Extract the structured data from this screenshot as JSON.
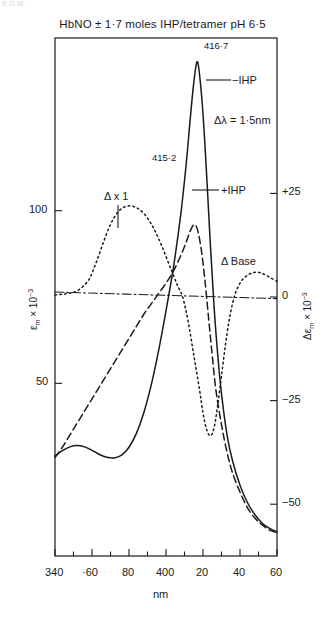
{
  "corner_stamp": "S.D.M.",
  "chart_data": {
    "type": "line",
    "title": "HbNO ± 1·7 moles IHP/tetramer pH 6·5",
    "xlabel": "nm",
    "ylabel": "εm × 10⁻³",
    "ylabel_right": "Δεm × 10⁻³",
    "xlim": [
      340,
      460
    ],
    "ylim": [
      0,
      150
    ],
    "ylim_right": [
      -62.5,
      62.5
    ],
    "grid": false,
    "legend_position": "inline-annotations",
    "x_ticks_major": [
      {
        "value": 340,
        "label": "340"
      },
      {
        "value": 360,
        "label": "·60"
      },
      {
        "value": 380,
        "label": "80"
      },
      {
        "value": 400,
        "label": "400"
      },
      {
        "value": 420,
        "label": "20"
      },
      {
        "value": 440,
        "label": "40"
      },
      {
        "value": 460,
        "label": "60"
      }
    ],
    "x_ticks_minor": [
      350,
      370,
      390,
      410,
      430,
      450
    ],
    "y_ticks_left": [
      {
        "value": 50,
        "label": "50"
      },
      {
        "value": 100,
        "label": "100"
      }
    ],
    "y_ticks_right": [
      {
        "value": 25,
        "label": "+25"
      },
      {
        "value": 0,
        "label": "0"
      },
      {
        "value": -25,
        "label": "−25"
      },
      {
        "value": -50,
        "label": "−50"
      }
    ],
    "annotations": [
      {
        "name": "peak-label-minus-ihp",
        "text": "416·7"
      },
      {
        "name": "peak-label-plus-ihp",
        "text": "415·2"
      },
      {
        "name": "series-label-minus-ihp",
        "text": "−IHP"
      },
      {
        "name": "series-label-plus-ihp",
        "text": "+IHP"
      },
      {
        "name": "delta-lambda-annotation",
        "text": "Δλ = 1·5nm"
      },
      {
        "name": "delta-multiplier-annotation",
        "text": "Δ x 1"
      },
      {
        "name": "delta-base-annotation",
        "text": "Δ Base"
      }
    ],
    "series": [
      {
        "name": "−IHP",
        "style": "solid",
        "axis": "left",
        "peak_nm": 416.7,
        "peak_value": 143,
        "points": [
          [
            340,
            29
          ],
          [
            344,
            30.5
          ],
          [
            348,
            31.6
          ],
          [
            352,
            32.0
          ],
          [
            356,
            31.6
          ],
          [
            360,
            30.6
          ],
          [
            364,
            29.4
          ],
          [
            368,
            28.6
          ],
          [
            372,
            28.4
          ],
          [
            376,
            29.2
          ],
          [
            380,
            31.5
          ],
          [
            384,
            35.5
          ],
          [
            388,
            41.5
          ],
          [
            392,
            49.5
          ],
          [
            396,
            59.5
          ],
          [
            400,
            71.0
          ],
          [
            404,
            83.5
          ],
          [
            408,
            99.0
          ],
          [
            411,
            114.0
          ],
          [
            413,
            126.0
          ],
          [
            415,
            137.0
          ],
          [
            416.7,
            143.0
          ],
          [
            418,
            140.0
          ],
          [
            420,
            128.0
          ],
          [
            422,
            110.0
          ],
          [
            424,
            90.0
          ],
          [
            426,
            72.0
          ],
          [
            428,
            58.0
          ],
          [
            430,
            47.0
          ],
          [
            433,
            35.0
          ],
          [
            436,
            27.5
          ],
          [
            440,
            20.5
          ],
          [
            444,
            15.5
          ],
          [
            448,
            12.0
          ],
          [
            452,
            9.5
          ],
          [
            456,
            8.0
          ],
          [
            460,
            7.0
          ]
        ]
      },
      {
        "name": "+IHP",
        "style": "dashed",
        "axis": "left",
        "peak_nm": 415.2,
        "peak_value": 96,
        "points": [
          [
            340,
            28.5
          ],
          [
            344,
            31.5
          ],
          [
            348,
            35.0
          ],
          [
            352,
            38.5
          ],
          [
            356,
            42.0
          ],
          [
            360,
            45.5
          ],
          [
            364,
            49.0
          ],
          [
            368,
            52.5
          ],
          [
            372,
            56.0
          ],
          [
            376,
            59.5
          ],
          [
            380,
            63.0
          ],
          [
            384,
            66.5
          ],
          [
            388,
            70.0
          ],
          [
            392,
            73.0
          ],
          [
            396,
            76.0
          ],
          [
            400,
            79.0
          ],
          [
            404,
            82.5
          ],
          [
            408,
            87.0
          ],
          [
            411,
            91.0
          ],
          [
            413,
            94.0
          ],
          [
            415.2,
            96.0
          ],
          [
            417,
            94.5
          ],
          [
            419,
            89.0
          ],
          [
            421,
            80.0
          ],
          [
            423,
            69.0
          ],
          [
            425,
            58.0
          ],
          [
            427,
            48.0
          ],
          [
            430,
            38.0
          ],
          [
            433,
            30.0
          ],
          [
            436,
            24.0
          ],
          [
            440,
            18.5
          ],
          [
            444,
            14.0
          ],
          [
            448,
            11.0
          ],
          [
            452,
            9.0
          ],
          [
            456,
            7.5
          ],
          [
            460,
            6.8
          ]
        ]
      },
      {
        "name": "Δ x 1",
        "style": "dotted",
        "axis": "right",
        "points": [
          [
            340,
            0.5
          ],
          [
            346,
            0.8
          ],
          [
            352,
            1.5
          ],
          [
            358,
            4.0
          ],
          [
            362,
            8.0
          ],
          [
            366,
            13.0
          ],
          [
            370,
            17.5
          ],
          [
            374,
            20.5
          ],
          [
            378,
            21.8
          ],
          [
            382,
            21.9
          ],
          [
            386,
            21.0
          ],
          [
            390,
            19.0
          ],
          [
            394,
            16.0
          ],
          [
            398,
            12.0
          ],
          [
            402,
            7.5
          ],
          [
            406,
            3.0
          ],
          [
            409,
            0.0
          ],
          [
            412,
            -6.0
          ],
          [
            415,
            -14.0
          ],
          [
            418,
            -22.0
          ],
          [
            420,
            -28.0
          ],
          [
            422,
            -32.0
          ],
          [
            424,
            -33.5
          ],
          [
            426,
            -31.5
          ],
          [
            428,
            -26.0
          ],
          [
            430,
            -19.0
          ],
          [
            432,
            -12.0
          ],
          [
            434,
            -6.0
          ],
          [
            436,
            -1.5
          ],
          [
            438,
            1.5
          ],
          [
            441,
            4.0
          ],
          [
            445,
            5.5
          ],
          [
            449,
            6.0
          ],
          [
            453,
            5.5
          ],
          [
            457,
            4.5
          ],
          [
            460,
            3.8
          ]
        ]
      },
      {
        "name": "Δ Base",
        "style": "dash-dot",
        "axis": "right",
        "points": [
          [
            340,
            1.2
          ],
          [
            400,
            0.4
          ],
          [
            460,
            -0.4
          ]
        ]
      }
    ]
  }
}
